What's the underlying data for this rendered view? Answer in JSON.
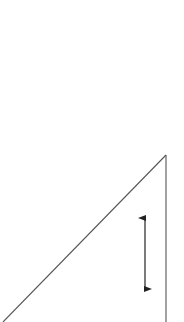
{
  "diagram": {
    "colors": {
      "background": "#ffffff",
      "triangle_stroke": "#555555",
      "arrow_stroke": "#222222"
    },
    "shapes": [
      {
        "id": "triangle-hypotenuse",
        "kind": "line"
      },
      {
        "id": "triangle-vertical-side",
        "kind": "line"
      },
      {
        "id": "height-arrow",
        "kind": "double-headed-arrow",
        "direction": "vertical"
      }
    ]
  }
}
